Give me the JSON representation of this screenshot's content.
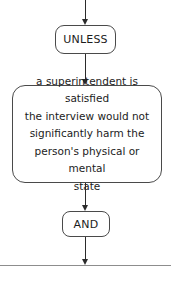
{
  "diagram": {
    "type": "flowchart",
    "orientation": "vertical-top-to-bottom",
    "background_color": "#ffffff",
    "line_color": "#2b2b2b",
    "border_color": "#4a4a4a",
    "text_color": "#1c1c1c",
    "nodes": [
      {
        "id": "unless",
        "shape": "rounded-rectangle",
        "label": "UNLESS"
      },
      {
        "id": "statement",
        "shape": "rounded-rectangle",
        "label": "a superintendent is satisfied\nthe interview would not\nsignificantly harm the\nperson's physical or mental\nstate",
        "lines": [
          "a superintendent is satisfied",
          "the interview would not",
          "significantly harm the",
          "person's physical or mental",
          "state"
        ]
      },
      {
        "id": "and",
        "shape": "rounded-rectangle",
        "label": "AND"
      }
    ],
    "connectors": [
      {
        "id": "into-unless",
        "from": "top-edge",
        "to": "unless",
        "arrow": "down"
      },
      {
        "id": "unless-to-statement",
        "from": "unless",
        "to": "statement",
        "arrow": "down"
      },
      {
        "id": "statement-to-and",
        "from": "statement",
        "to": "and",
        "arrow": "down"
      },
      {
        "id": "and-to-divider",
        "from": "and",
        "to": "divider",
        "arrow": "down"
      }
    ],
    "divider": {
      "id": "section-divider",
      "color": "#8d8d8d"
    },
    "clipped_footer_text": ""
  }
}
